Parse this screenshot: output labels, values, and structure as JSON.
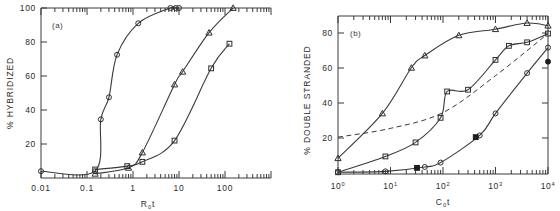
{
  "figure": {
    "background": "#ffffff",
    "ink_color": "#2e2e2e",
    "panels": [
      "a",
      "b"
    ]
  },
  "panel_a": {
    "label": "(a)",
    "ylabel": "% HYBRIDIZED",
    "xlabel_main": "R",
    "xlabel_sub": "0",
    "xlabel_tail": "t",
    "ytick_labels": [
      "100",
      "80",
      "60",
      "40",
      "20"
    ],
    "xtick_labels": [
      "0.01",
      "0.1",
      "1",
      "10",
      "100"
    ]
  },
  "panel_b": {
    "label": "(b)",
    "ylabel": "% DOUBLE STRANDED",
    "xlabel_main": "C",
    "xlabel_sub": "0",
    "xlabel_tail": "t",
    "ytick_labels": [
      "80",
      "60",
      "40",
      "20"
    ],
    "xtick_mantissa": "10",
    "xtick_exponents": [
      "0",
      "1",
      "2",
      "3",
      "4"
    ]
  },
  "chart_data": [
    {
      "type": "line",
      "panel": "a",
      "title": "",
      "xlabel": "R0t",
      "ylabel": "% HYBRIDIZED",
      "xscale": "log",
      "xlim": [
        0.01,
        1000
      ],
      "ylim": [
        0,
        100
      ],
      "grid": false,
      "legend": "none",
      "xtick_values": [
        0.01,
        0.1,
        1,
        10,
        100
      ],
      "xtick_labels": [
        "0.01",
        "0.1",
        "1",
        "10",
        "100"
      ],
      "ytick_values": [
        20,
        40,
        60,
        80,
        100
      ],
      "ytick_labels": [
        "20",
        "40",
        "60",
        "80",
        "100"
      ],
      "series": [
        {
          "name": "curve-left-circles",
          "marker": "open-circle",
          "linestyle": "solid",
          "x": [
            0.01,
            0.15,
            0.2,
            0.3,
            0.45,
            1.3,
            6.5,
            8.5,
            10.0
          ],
          "y": [
            4.0,
            4.0,
            34.5,
            47.5,
            72.5,
            91.0,
            100.0,
            100.0,
            100.0
          ]
        },
        {
          "name": "curve-middle-triangles",
          "marker": "open-triangle",
          "linestyle": "solid",
          "x": [
            0.15,
            0.8,
            1.6,
            8.0,
            12.0,
            45.0,
            150.0
          ],
          "y": [
            2.5,
            6.0,
            15.0,
            55.0,
            62.5,
            85.5,
            100.0
          ]
        },
        {
          "name": "curve-right-squares",
          "marker": "open-square",
          "linestyle": "solid",
          "x": [
            0.15,
            0.75,
            1.6,
            8.0,
            50.0,
            125.0
          ],
          "y": [
            5.0,
            7.0,
            9.5,
            22.0,
            64.5,
            79.0
          ]
        }
      ]
    },
    {
      "type": "line",
      "panel": "b",
      "title": "",
      "xlabel": "C0t",
      "ylabel": "% DOUBLE STRANDED",
      "xscale": "log",
      "xlim": [
        1,
        10000
      ],
      "ylim": [
        0,
        90
      ],
      "grid": false,
      "legend": "none",
      "xtick_values": [
        1,
        10,
        100,
        1000,
        10000
      ],
      "xtick_labels": [
        "10^0",
        "10^1",
        "10^2",
        "10^3",
        "10^4"
      ],
      "ytick_values": [
        20,
        40,
        60,
        80
      ],
      "ytick_labels": [
        "20",
        "40",
        "60",
        "80"
      ],
      "series": [
        {
          "name": "fast-triangles",
          "marker": "open-triangle",
          "linestyle": "solid",
          "x": [
            1.0,
            7.0,
            25.0,
            45.0,
            200.0,
            1000.0,
            4000.0,
            10000.0
          ],
          "y": [
            9.0,
            34.5,
            60.5,
            67.5,
            79.0,
            82.5,
            86.0,
            84.5
          ]
        },
        {
          "name": "mid-squares",
          "marker": "open-square",
          "linestyle": "solid",
          "x": [
            1.0,
            8.0,
            30.0,
            90.0,
            120.0,
            300.0,
            1000.0,
            1800.0,
            4000.0,
            10000.0
          ],
          "y": [
            1.0,
            10.0,
            18.0,
            32.0,
            47.0,
            48.0,
            65.0,
            73.0,
            75.0,
            80.0
          ]
        },
        {
          "name": "slow-circles",
          "marker": "open-circle",
          "linestyle": "solid",
          "x": [
            1.0,
            8.0,
            45.0,
            90.0,
            500.0,
            1000.0,
            4000.0,
            10000.0
          ],
          "y": [
            1.0,
            1.5,
            4.0,
            6.5,
            22.0,
            34.5,
            57.5,
            72.0
          ]
        },
        {
          "name": "filled-squares",
          "marker": "filled-square",
          "linestyle": "none",
          "x": [
            32.0,
            420.0
          ],
          "y": [
            3.5,
            21.0
          ]
        },
        {
          "name": "filled-circle",
          "marker": "filled-circle",
          "linestyle": "none",
          "x": [
            10000.0
          ],
          "y": [
            64.0
          ]
        },
        {
          "name": "theoretical-dashed",
          "marker": "none",
          "linestyle": "dashed",
          "x": [
            1.0,
            10.0,
            100.0,
            1000.0,
            10000.0
          ],
          "y": [
            21.0,
            26.0,
            35.0,
            56.0,
            80.0
          ]
        }
      ]
    }
  ]
}
